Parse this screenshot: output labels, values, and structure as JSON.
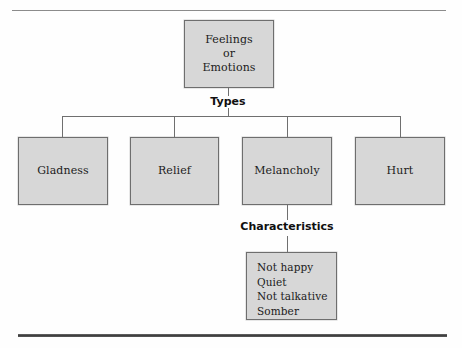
{
  "figure": {
    "root": {
      "lines": [
        "Feelings",
        "or",
        "Emotions"
      ]
    },
    "edge_labels": {
      "types": "Types",
      "characteristics": "Characteristics"
    },
    "types": [
      {
        "label": "Gladness"
      },
      {
        "label": "Relief"
      },
      {
        "label": "Melancholy"
      },
      {
        "label": "Hurt"
      }
    ],
    "characteristics": {
      "parent": "Melancholy",
      "items": [
        "Not happy",
        "Quiet",
        "Not talkative",
        "Somber"
      ]
    },
    "colors": {
      "box_fill": "#d7d7d7",
      "box_border": "#6e6e6e",
      "connector": "#6f6f6f",
      "text": "#1b1b1b",
      "rule_top": "#8a8a8a",
      "rule_bottom": "#3d3d3d",
      "background": "#fefefe"
    }
  }
}
